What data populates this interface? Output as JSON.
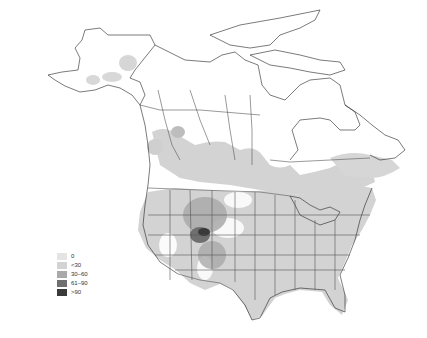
{
  "map": {
    "region": "North America",
    "type": "choropleth / density map",
    "fill_colors": {
      "land": "#ffffff",
      "boundary": "#555555",
      "coast": "#222222"
    }
  },
  "legend": {
    "items": [
      {
        "label": "0",
        "color": "#e4e4e4"
      },
      {
        "label": "<30",
        "color": "#d3d3d3"
      },
      {
        "label": "30–60",
        "color": "#a9a9a9"
      },
      {
        "label": "61–90",
        "color": "#6f6f6f"
      },
      {
        "label": ">90",
        "color": "#3a3a3a"
      }
    ]
  }
}
